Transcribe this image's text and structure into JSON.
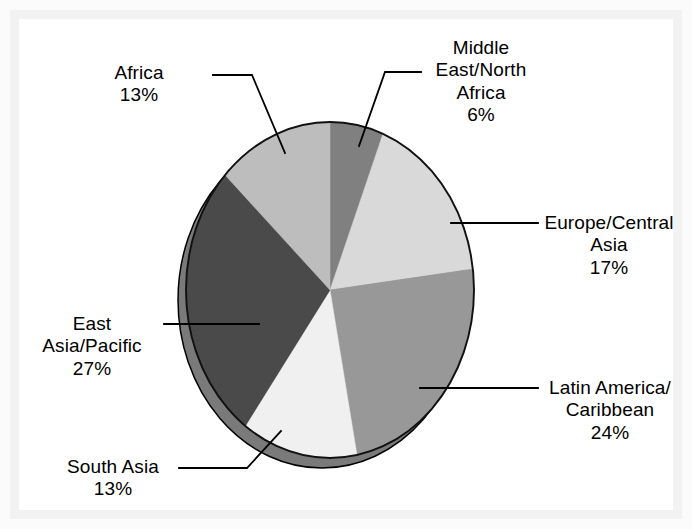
{
  "figure": {
    "background_color": "#ffffff",
    "frame_color": "#f2f2f2"
  },
  "chart_data": {
    "type": "pie",
    "title": "",
    "subtitle": "",
    "xlabel": "",
    "ylabel": "",
    "legend_position": "none",
    "grid": false,
    "start_angle_deg": 0,
    "direction": "clockwise",
    "value_unit": "percent",
    "total": 100,
    "categories": [
      "Middle East/North Africa",
      "Europe/Central Asia",
      "Latin America/Caribbean",
      "South Asia",
      "East Asia/Pacific",
      "Africa"
    ],
    "values": [
      6,
      17,
      24,
      13,
      27,
      13
    ],
    "value_labels": [
      "6%",
      "17%",
      "24%",
      "13%",
      "27%",
      "13%"
    ],
    "colors": [
      "#808080",
      "#d9d9d9",
      "#989898",
      "#f0f0f0",
      "#4a4a4a",
      "#bdbdbd"
    ],
    "slices": [
      {
        "name": "Middle East/North Africa",
        "value": 6,
        "value_label": "6%",
        "color": "#808080",
        "label_lines": [
          "Middle",
          "East/North",
          "Africa",
          "6%"
        ],
        "label_align": "center"
      },
      {
        "name": "Europe/Central Asia",
        "value": 17,
        "value_label": "17%",
        "color": "#d9d9d9",
        "label_lines": [
          "Europe/Central",
          "Asia",
          "17%"
        ],
        "label_align": "center"
      },
      {
        "name": "Latin America/Caribbean",
        "value": 24,
        "value_label": "24%",
        "color": "#989898",
        "label_lines": [
          "Latin America/",
          "Caribbean",
          "24%"
        ],
        "label_align": "center"
      },
      {
        "name": "South Asia",
        "value": 13,
        "value_label": "13%",
        "color": "#f0f0f0",
        "label_lines": [
          "South Asia",
          "13%"
        ],
        "label_align": "center"
      },
      {
        "name": "East Asia/Pacific",
        "value": 27,
        "value_label": "27%",
        "color": "#4a4a4a",
        "label_lines": [
          "East",
          "Asia/Pacific",
          "27%"
        ],
        "label_align": "center"
      },
      {
        "name": "Africa",
        "value": 13,
        "value_label": "13%",
        "color": "#bdbdbd",
        "label_lines": [
          "Africa",
          "13%"
        ],
        "label_align": "center"
      }
    ]
  },
  "labels": {
    "middle_east": {
      "line1": "Middle",
      "line2": "East/North",
      "line3": "Africa",
      "line4": "6%"
    },
    "europe": {
      "line1": "Europe/Central",
      "line2": "Asia",
      "line3": "17%"
    },
    "latin_america": {
      "line1": "Latin America/",
      "line2": "Caribbean",
      "line3": "24%"
    },
    "south_asia": {
      "line1": "South Asia",
      "line2": "13%"
    },
    "east_asia": {
      "line1": "East",
      "line2": "Asia/Pacific",
      "line3": "27%"
    },
    "africa": {
      "line1": "Africa",
      "line2": "13%"
    }
  }
}
